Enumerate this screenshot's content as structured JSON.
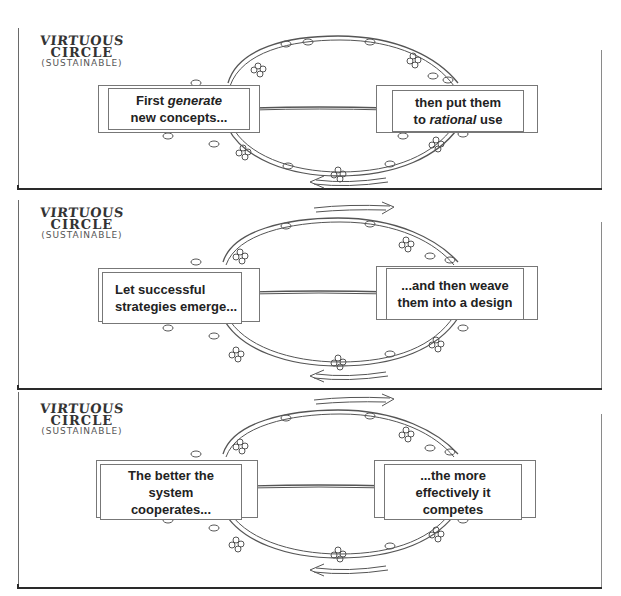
{
  "diagram": {
    "type": "cyclic-process",
    "style": "hand-drawn vine circle with two hanging signs",
    "colors": {
      "line": "#555555",
      "text": "#222222",
      "background": "#ffffff"
    },
    "panels": [
      {
        "title_line1": "VIRTUOUS",
        "title_line2": "CIRCLE",
        "title_line3": "(SUSTAINABLE)",
        "left_label": {
          "line1_pre": "First ",
          "line1_emph": "generate",
          "line1_post": "",
          "line2": "new concepts...",
          "line3": ""
        },
        "right_label": {
          "line1_pre": "then put them",
          "line1_emph": "",
          "line1_post": "",
          "line2_pre": "to ",
          "line2_emph": "rational",
          "line2_post": " use",
          "line3": ""
        },
        "top_arrow": "right",
        "bottom_arrow": "left"
      },
      {
        "title_line1": "VIRTUOUS",
        "title_line2": "CIRCLE",
        "title_line3": "(SUSTAINABLE)",
        "left_label": {
          "line1": "Let successful",
          "line2": "strategies emerge..."
        },
        "right_label": {
          "line1": "...and then weave",
          "line2": "them into a design"
        },
        "top_arrow": "right",
        "bottom_arrow": "left"
      },
      {
        "title_line1": "VIRTUOUS",
        "title_line2": "CIRCLE",
        "title_line3": "(SUSTAINABLE)",
        "left_label": {
          "line1": "The better the",
          "line2": "system",
          "line3": "cooperates..."
        },
        "right_label": {
          "line1": "...the more",
          "line2": "effectively it",
          "line3": "competes"
        },
        "top_arrow": "right",
        "bottom_arrow": "left"
      }
    ]
  }
}
